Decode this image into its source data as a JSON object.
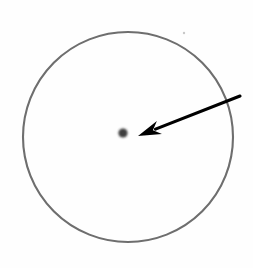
{
  "figure": {
    "title": "Circle with center point indicated by arrow",
    "kind": "geometry-diagram",
    "canvas": {
      "width": 253,
      "height": 268,
      "background_color": "#fefefe"
    },
    "shapes": {
      "circle": {
        "label": "circle-outline",
        "center_x": 128,
        "center_y": 137,
        "radius": 105,
        "stroke_color": "#6e6e6e",
        "stroke_width": 2.1,
        "fill": "none"
      },
      "center_dot": {
        "label": "center-point-dot",
        "center_x": 123,
        "center_y": 133,
        "radius": 4.6,
        "fill_color": "#3c3c3c"
      },
      "arrow": {
        "label": "pointer-arrow",
        "tail_x": 240,
        "tail_y": 96,
        "tip_x": 138,
        "tip_y": 136,
        "stroke_color": "#000000",
        "stroke_width": 3.1,
        "head_length": 23,
        "head_half_width": 7,
        "head_barb_inset": 7,
        "direction": "upper-right to center"
      },
      "speck": {
        "label": "stray-speck",
        "center_x": 184,
        "center_y": 33,
        "radius": 1.2,
        "fill_color": "#c8c8c8"
      }
    }
  }
}
